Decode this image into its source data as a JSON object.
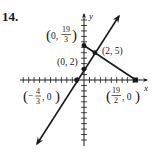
{
  "problem": {
    "number": "14."
  },
  "axes": {
    "x_label": "x",
    "y_label": "y"
  },
  "colors": {
    "ink": "#1a1a1a",
    "background": "#ffffff"
  },
  "points": [
    {
      "name": "y-intercept-line2",
      "label_prefix": "(0, ",
      "label_num": "19",
      "label_den": "3",
      "label_suffix": ")",
      "x": 0,
      "y": 6.333
    },
    {
      "name": "intersection",
      "label": "(2, 5)",
      "x": 2,
      "y": 5
    },
    {
      "name": "y-intercept-line1",
      "label": "(0, 2)",
      "x": 0,
      "y": 2
    },
    {
      "name": "x-intercept-line1",
      "label_prefix": "(−",
      "label_num": "4",
      "label_den": "3",
      "label_suffix": ", 0)",
      "x": -1.333,
      "y": 0
    },
    {
      "name": "x-intercept-line2",
      "label_prefix": "(",
      "label_num": "19",
      "label_den": "2",
      "label_suffix": ", 0)",
      "x": 9.5,
      "y": 0
    }
  ],
  "lines": [
    {
      "name": "line-through-0-2-and-2-5",
      "slope": 1.5,
      "intercept": 2,
      "type": "line"
    },
    {
      "name": "segment-0-19/3-to-19/2-0",
      "slope": -0.6667,
      "intercept": 6.333,
      "type": "segment"
    }
  ]
}
